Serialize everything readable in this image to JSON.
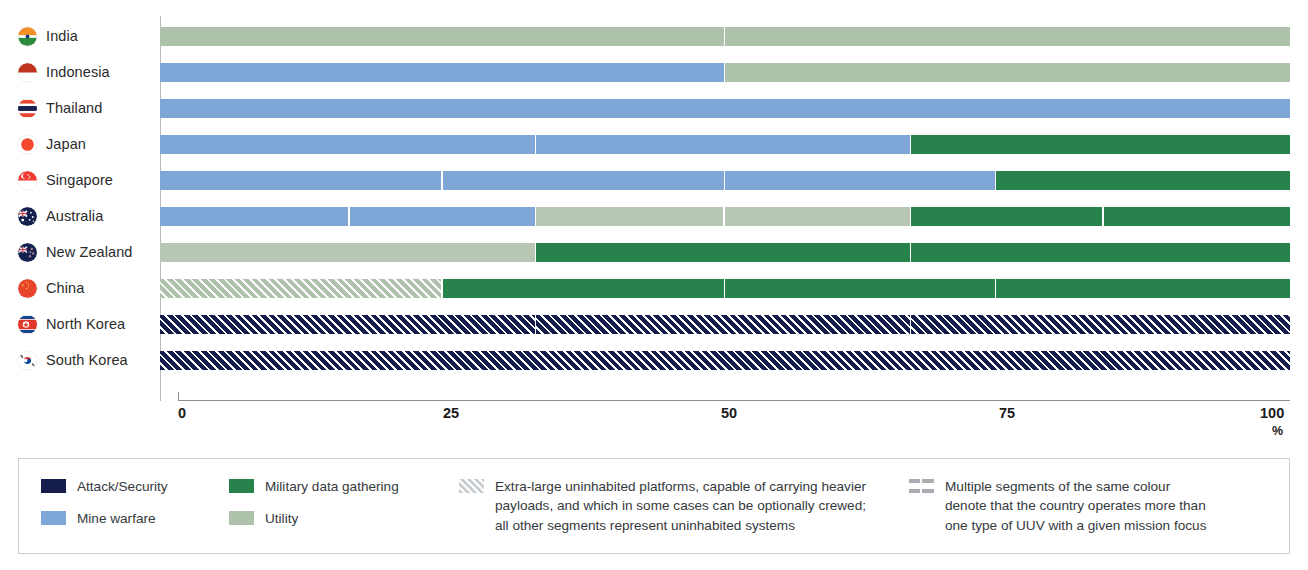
{
  "chart_data": {
    "type": "bar",
    "orientation": "horizontal",
    "stacked": true,
    "title": "",
    "xlabel": "%",
    "ylabel": "",
    "xlim": [
      0,
      100
    ],
    "xticks": [
      "0",
      "25",
      "50",
      "75",
      "100"
    ],
    "unit": "%",
    "grid": false,
    "legend_position": "bottom",
    "categories": [
      "India",
      "Indonesia",
      "Thailand",
      "Japan",
      "Singapore",
      "Australia",
      "New Zealand",
      "China",
      "North Korea",
      "South Korea"
    ],
    "series": [
      {
        "name": "Attack/Security",
        "color": "#151d4d",
        "values": [
          0,
          0,
          0,
          0,
          0,
          0,
          0,
          0,
          100,
          100
        ]
      },
      {
        "name": "Mine warfare",
        "color": "#7ea7d7",
        "values": [
          0,
          50,
          100,
          66.5,
          74,
          33.5,
          0,
          0,
          0,
          0
        ]
      },
      {
        "name": "Military data gathering",
        "color": "#27834b",
        "values": [
          0,
          0,
          0,
          33.5,
          26,
          33.5,
          66.5,
          75,
          0,
          0
        ]
      },
      {
        "name": "Utility",
        "color": "#afc2ab",
        "values": [
          100,
          50,
          0,
          0,
          0,
          33,
          33.5,
          25,
          0,
          0
        ]
      }
    ],
    "bars": [
      {
        "country": "India",
        "flag": "flag-india",
        "segments": [
          {
            "series": "Utility",
            "color": "#afc2ab",
            "start": 0,
            "end": 50,
            "hatched": false
          },
          {
            "series": "Utility",
            "color": "#afc2ab",
            "start": 50,
            "end": 100,
            "hatched": false
          }
        ]
      },
      {
        "country": "Indonesia",
        "flag": "flag-indonesia",
        "segments": [
          {
            "series": "Mine warfare",
            "color": "#7ea7d7",
            "start": 0,
            "end": 50,
            "hatched": false
          },
          {
            "series": "Utility",
            "color": "#afc2ab",
            "start": 50,
            "end": 100,
            "hatched": false
          }
        ]
      },
      {
        "country": "Thailand",
        "flag": "flag-thailand",
        "segments": [
          {
            "series": "Mine warfare",
            "color": "#7ea7d7",
            "start": 0,
            "end": 100,
            "hatched": false
          }
        ]
      },
      {
        "country": "Japan",
        "flag": "flag-japan",
        "segments": [
          {
            "series": "Mine warfare",
            "color": "#7ea7d7",
            "start": 0,
            "end": 33.3,
            "hatched": false
          },
          {
            "series": "Mine warfare",
            "color": "#7ea7d7",
            "start": 33.3,
            "end": 66.5,
            "hatched": false
          },
          {
            "series": "Military data gathering",
            "color": "#27834b",
            "start": 66.5,
            "end": 100,
            "hatched": false
          }
        ]
      },
      {
        "country": "Singapore",
        "flag": "flag-singapore",
        "segments": [
          {
            "series": "Mine warfare",
            "color": "#7ea7d7",
            "start": 0,
            "end": 25,
            "hatched": false
          },
          {
            "series": "Mine warfare",
            "color": "#7ea7d7",
            "start": 25,
            "end": 50,
            "hatched": false
          },
          {
            "series": "Mine warfare",
            "color": "#7ea7d7",
            "start": 50,
            "end": 74,
            "hatched": false
          },
          {
            "series": "Military data gathering",
            "color": "#27834b",
            "start": 74,
            "end": 100,
            "hatched": false
          }
        ]
      },
      {
        "country": "Australia",
        "flag": "flag-australia",
        "segments": [
          {
            "series": "Mine warfare",
            "color": "#7ea7d7",
            "start": 0,
            "end": 16.8,
            "hatched": false
          },
          {
            "series": "Mine warfare",
            "color": "#7ea7d7",
            "start": 16.8,
            "end": 33.3,
            "hatched": false
          },
          {
            "series": "Utility",
            "color": "#b8c7b4",
            "start": 33.3,
            "end": 50,
            "hatched": false
          },
          {
            "series": "Utility",
            "color": "#b8c7b4",
            "start": 50,
            "end": 66.5,
            "hatched": false
          },
          {
            "series": "Military data gathering",
            "color": "#27834b",
            "start": 66.5,
            "end": 83.5,
            "hatched": false
          },
          {
            "series": "Military data gathering",
            "color": "#27834b",
            "start": 83.5,
            "end": 100,
            "hatched": false
          }
        ]
      },
      {
        "country": "New Zealand",
        "flag": "flag-new-zealand",
        "segments": [
          {
            "series": "Utility",
            "color": "#b8c7b4",
            "start": 0,
            "end": 33.3,
            "hatched": false
          },
          {
            "series": "Military data gathering",
            "color": "#27834b",
            "start": 33.3,
            "end": 66.5,
            "hatched": false
          },
          {
            "series": "Military data gathering",
            "color": "#27834b",
            "start": 66.5,
            "end": 100,
            "hatched": false
          }
        ]
      },
      {
        "country": "China",
        "flag": "flag-china",
        "segments": [
          {
            "series": "Utility",
            "color": "#afc2ab",
            "start": 0,
            "end": 25,
            "hatched": true
          },
          {
            "series": "Military data gathering",
            "color": "#27834b",
            "start": 25,
            "end": 50,
            "hatched": false
          },
          {
            "series": "Military data gathering",
            "color": "#27834b",
            "start": 50,
            "end": 74,
            "hatched": false
          },
          {
            "series": "Military data gathering",
            "color": "#27834b",
            "start": 74,
            "end": 100,
            "hatched": false
          }
        ]
      },
      {
        "country": "North Korea",
        "flag": "flag-north-korea",
        "segments": [
          {
            "series": "Attack/Security",
            "color": "#151d4d",
            "start": 0,
            "end": 33.3,
            "hatched": true
          },
          {
            "series": "Attack/Security",
            "color": "#151d4d",
            "start": 33.3,
            "end": 66.5,
            "hatched": true
          },
          {
            "series": "Attack/Security",
            "color": "#151d4d",
            "start": 66.5,
            "end": 100,
            "hatched": true
          }
        ]
      },
      {
        "country": "South Korea",
        "flag": "flag-south-korea",
        "segments": [
          {
            "series": "Attack/Security",
            "color": "#151d4d",
            "start": 0,
            "end": 100,
            "hatched": true
          }
        ]
      }
    ]
  },
  "axis": {
    "ticks": [
      {
        "label": "0",
        "value": 0
      },
      {
        "label": "25",
        "value": 25
      },
      {
        "label": "50",
        "value": 50
      },
      {
        "label": "75",
        "value": 75
      },
      {
        "label": "100",
        "value": 100
      }
    ],
    "unit": "%"
  },
  "legend": {
    "column1": [
      {
        "label": "Attack/Security",
        "color": "#151d4d",
        "swatch": "solid"
      },
      {
        "label": "Mine warfare",
        "color": "#7ea7d7",
        "swatch": "solid"
      }
    ],
    "column2": [
      {
        "label": "Military data gathering",
        "color": "#27834b",
        "swatch": "solid"
      },
      {
        "label": "Utility",
        "color": "#afc2ab",
        "swatch": "solid"
      }
    ],
    "note_hatched": {
      "swatch": "hatched",
      "color": "#c9cfd3",
      "line1": "Extra-large uninhabited platforms, capable of carrying heavier",
      "line2": "payloads, and which in some cases can be optionally crewed;",
      "line3": "all other segments represent uninhabited systems"
    },
    "note_segments": {
      "swatch": "multi-segment",
      "color": "#a9adb2",
      "line1": "Multiple segments of the same colour",
      "line2": "denote that the country operates more than",
      "line3": "one type of UUV with a given mission focus"
    }
  },
  "colors": {
    "attack_security": "#151d4d",
    "mine_warfare": "#7ea7d7",
    "military_data_gathering": "#27834b",
    "utility": "#afc2ab",
    "axis": "#8d8d8d",
    "legend_border": "#cfcfcf",
    "text": "#35393d"
  }
}
